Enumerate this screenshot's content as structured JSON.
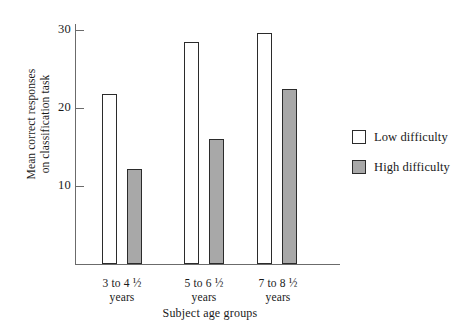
{
  "chart_data": {
    "type": "bar",
    "title": "",
    "xlabel": "Subject age groups",
    "ylabel_line1": "Mean correct responses",
    "ylabel_line2": "on classification task",
    "categories": [
      "3 to 4 ½ years",
      "5 to 6 ½ years",
      "7 to 8 ½ years"
    ],
    "category_lines": [
      {
        "line1": "3 to 4 ½",
        "line2": "years"
      },
      {
        "line1": "5 to 6 ½",
        "line2": "years"
      },
      {
        "line1": "7 to 8 ½",
        "line2": "years"
      }
    ],
    "series": [
      {
        "name": "Low difficulty",
        "values": [
          21.8,
          28.4,
          29.6
        ],
        "color": "#ffffff"
      },
      {
        "name": "High difficulty",
        "values": [
          12.2,
          16.0,
          22.4
        ],
        "color": "#a8a8a8"
      }
    ],
    "yticks": [
      10,
      20,
      30
    ],
    "ytick_labels": [
      "10",
      "20",
      "30"
    ],
    "ylim": [
      0,
      31
    ],
    "grid": false,
    "legend_position": "right"
  },
  "legend": {
    "items": [
      {
        "label": "Low difficulty",
        "swatch": "white-square"
      },
      {
        "label": "High difficulty",
        "swatch": "gray-square"
      }
    ]
  },
  "axis": {
    "y_title_line1": "Mean correct responses",
    "y_title_line2": "on classification task",
    "x_title": "Subject age groups"
  }
}
